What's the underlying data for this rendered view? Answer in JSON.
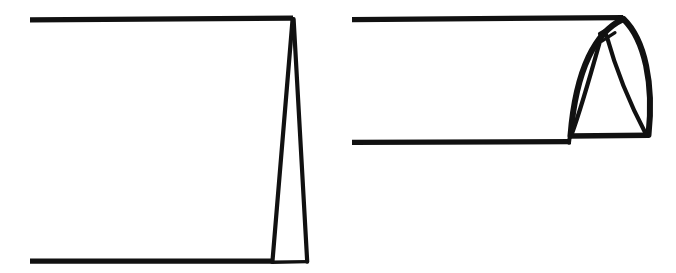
{
  "figure": {
    "background_color": "#ffffff",
    "ink_color": "#111111",
    "canvas": {
      "width": 676,
      "height": 273
    },
    "panel_count": 2,
    "panels": [
      {
        "id": "left-panel",
        "name": "flat-folded-form",
        "description": "Two long horizontal rules closed at the right by a tall narrow triangular fold",
        "strokes": [
          {
            "name": "upper-horizontal-rule",
            "type": "line",
            "points": "30,19 293,18",
            "width": 5
          },
          {
            "name": "lower-horizontal-rule",
            "type": "line",
            "points": "30,261 272,261",
            "width": 5
          },
          {
            "name": "fold-left-edge",
            "type": "line",
            "points": "293,18 272,262",
            "width": 4
          },
          {
            "name": "fold-right-edge",
            "type": "line",
            "points": "293,18 307,262",
            "width": 4
          },
          {
            "name": "fold-base",
            "type": "line",
            "points": "272,262 307,262",
            "width": 3
          }
        ]
      },
      {
        "id": "right-panel",
        "name": "opened-curved-form",
        "description": "Two long horizontal rules closed at the right by a rounded pointed hood with two inner fold lines",
        "strokes": [
          {
            "name": "upper-horizontal-rule",
            "type": "line",
            "points": "352,18 622,18",
            "width": 5
          },
          {
            "name": "lower-horizontal-rule",
            "type": "line",
            "points": "352,142 570,142",
            "width": 5
          },
          {
            "name": "hood-base",
            "type": "line",
            "points": "570,136 648,136",
            "width": 5
          },
          {
            "name": "hood-outer-left-curve",
            "type": "curve",
            "points": "622,18 C 585,40 569,90 569,136",
            "width": 6
          },
          {
            "name": "hood-outer-right-curve",
            "type": "curve",
            "points": "622,18 C 650,45 652,95 648,136",
            "width": 6
          },
          {
            "name": "apex-notch",
            "type": "line",
            "points": "622,20 598,34 601,42 614,33",
            "width": 3
          },
          {
            "name": "inner-fold-left",
            "type": "curve",
            "points": "601,36 C 592,70 582,108 572,134",
            "width": 4
          },
          {
            "name": "inner-fold-right",
            "type": "curve",
            "points": "606,36 C 617,72 632,108 646,134",
            "width": 4
          }
        ]
      }
    ]
  }
}
